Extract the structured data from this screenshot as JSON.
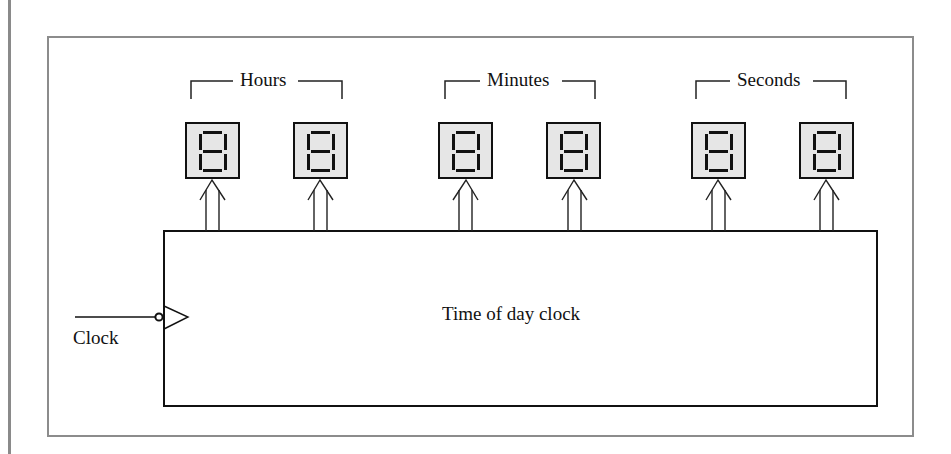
{
  "diagram": {
    "title": "Time of day clock",
    "input": {
      "label": "Clock",
      "edge": "negative-edge-triggered"
    },
    "groups": [
      {
        "label": "Hours",
        "digits": 2
      },
      {
        "label": "Minutes",
        "digits": 2
      },
      {
        "label": "Seconds",
        "digits": 2
      }
    ],
    "displays": [
      {
        "group": "Hours",
        "value": "8",
        "type": "seven-segment"
      },
      {
        "group": "Hours",
        "value": "8",
        "type": "seven-segment"
      },
      {
        "group": "Minutes",
        "value": "8",
        "type": "seven-segment"
      },
      {
        "group": "Minutes",
        "value": "8",
        "type": "seven-segment"
      },
      {
        "group": "Seconds",
        "value": "8",
        "type": "seven-segment"
      },
      {
        "group": "Seconds",
        "value": "8",
        "type": "seven-segment"
      }
    ],
    "colors": {
      "line": "#111111",
      "frame": "#8c8c8c",
      "display_fill": "#e6e6e6"
    }
  }
}
